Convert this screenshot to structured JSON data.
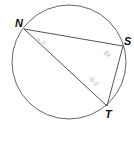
{
  "diagram": {
    "type": "inscribed-triangle-in-circle",
    "circle": {
      "cx": 69,
      "cy": 62,
      "r": 57,
      "stroke": "#666666"
    },
    "points": [
      {
        "id": "N",
        "label": "N",
        "x": 24,
        "y": 29,
        "label_x": 15,
        "label_y": 27
      },
      {
        "id": "S",
        "label": "S",
        "x": 123,
        "y": 46,
        "label_x": 124,
        "label_y": 45
      },
      {
        "id": "T",
        "label": "T",
        "x": 107,
        "y": 106,
        "label_x": 105,
        "label_y": 118
      }
    ],
    "segments": [
      {
        "from": "N",
        "to": "S"
      },
      {
        "from": "S",
        "to": "T"
      },
      {
        "from": "N",
        "to": "T"
      }
    ],
    "angle_labels": [
      {
        "at": "N",
        "text": "a-2",
        "x": 35,
        "y": 40,
        "rotate": 40
      },
      {
        "at": "S",
        "text": "8x",
        "x": 105,
        "y": 52,
        "rotate": 30
      },
      {
        "at": "T",
        "text": "6-y",
        "x": 91,
        "y": 82,
        "rotate": 40
      }
    ],
    "line_color": "#555555",
    "label_color": "#111111",
    "angle_label_color": "#b8b8b8"
  }
}
